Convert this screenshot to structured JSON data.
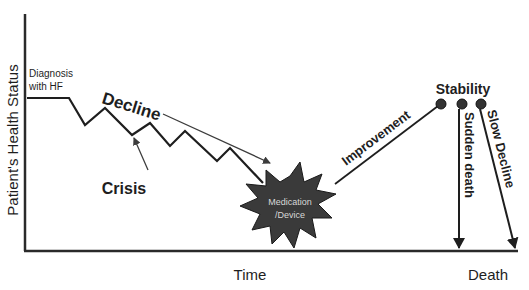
{
  "diagram": {
    "y_axis_label": "Patient's Health Status",
    "x_axis_label": "Time",
    "end_label": "Death",
    "labels": {
      "diagnosis_line1": "Diagnosis",
      "diagnosis_line2": "with HF",
      "decline": "Decline",
      "crisis": "Crisis",
      "intervention_line1": "Medication",
      "intervention_line2": "/Device",
      "improvement": "Improvement",
      "stability": "Stability",
      "sudden_death": "Sudden death",
      "slow_decline": "Slow Decline"
    },
    "colors": {
      "line": "#1e1e1e",
      "starburst_fill": "#3a3a3a",
      "starburst_text": "#d8d8d8",
      "arrow": "#3c3c3c"
    },
    "nodes": [
      {
        "id": "diagnosis",
        "label": "Diagnosis with HF"
      },
      {
        "id": "decline",
        "label": "Decline"
      },
      {
        "id": "crisis",
        "label": "Crisis"
      },
      {
        "id": "intervention",
        "label": "Medication /Device"
      },
      {
        "id": "improvement",
        "label": "Improvement"
      },
      {
        "id": "stability",
        "label": "Stability"
      },
      {
        "id": "sudden_death",
        "label": "Sudden death"
      },
      {
        "id": "slow_decline",
        "label": "Slow Decline"
      },
      {
        "id": "death",
        "label": "Death"
      }
    ],
    "edges": [
      {
        "from": "diagnosis",
        "to": "decline"
      },
      {
        "from": "decline",
        "to": "intervention"
      },
      {
        "from": "intervention",
        "to": "improvement"
      },
      {
        "from": "improvement",
        "to": "stability"
      },
      {
        "from": "stability",
        "to": "sudden_death"
      },
      {
        "from": "stability",
        "to": "slow_decline"
      },
      {
        "from": "sudden_death",
        "to": "death"
      },
      {
        "from": "slow_decline",
        "to": "death"
      }
    ]
  }
}
